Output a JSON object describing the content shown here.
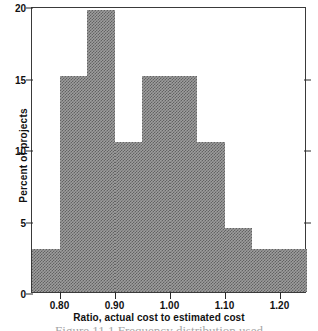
{
  "chart_data": {
    "type": "bar",
    "title": "",
    "xlabel": "Ratio, actual cost to estimated cost",
    "ylabel": "Percent of projects",
    "categories": [
      "0.75-0.80",
      "0.80-0.85",
      "0.85-0.90",
      "0.90-0.95",
      "0.95-1.00",
      "1.00-1.05",
      "1.05-1.10",
      "1.10-1.15",
      "1.15-1.20",
      "1.20-1.25"
    ],
    "bin_edges": [
      0.75,
      0.8,
      0.85,
      0.9,
      0.95,
      1.0,
      1.05,
      1.1,
      1.15,
      1.2,
      1.25
    ],
    "values": [
      3.0,
      15.1,
      19.7,
      10.5,
      15.1,
      15.1,
      10.5,
      4.5,
      3.0,
      3.0
    ],
    "xlim": [
      0.75,
      1.25
    ],
    "ylim": [
      0,
      20
    ],
    "grid": false,
    "legend": null,
    "bar_fill": "#9d9d9d",
    "bar_edge": "#232323",
    "y_ticks": [
      {
        "value": 20,
        "label": "20"
      },
      {
        "value": 15,
        "label": "15"
      },
      {
        "value": 10,
        "label": "10"
      },
      {
        "value": 5,
        "label": "5"
      },
      {
        "value": 0,
        "label": "0"
      }
    ],
    "x_ticks": [
      {
        "value": 0.8,
        "label": "0.80"
      },
      {
        "value": 0.9,
        "label": "0.90"
      },
      {
        "value": 1.0,
        "label": "1.00"
      },
      {
        "value": 1.1,
        "label": "1.10"
      },
      {
        "value": 1.2,
        "label": "1.20"
      }
    ]
  },
  "caption": {
    "text": "Figure 11.1   Frequency distribution used"
  }
}
